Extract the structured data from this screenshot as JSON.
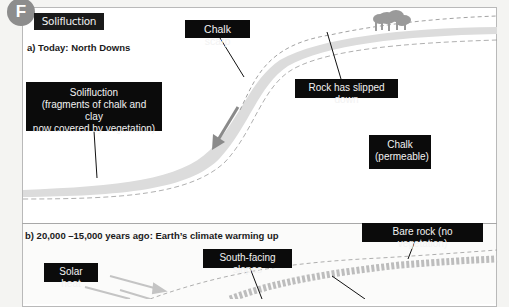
{
  "figure": {
    "badge_letter": "F",
    "title": "Solifluction",
    "colors": {
      "badge": "#8d8d8d",
      "label_bg": "#0b0b0b",
      "label_text": "#f2f2f2",
      "soil_band": "#d9d9d9",
      "dashed_line": "#8a8a8a",
      "arrow": "#8f8f8f",
      "trees": "#9a9a9a"
    }
  },
  "panel_a": {
    "heading": "a) Today: North Downs",
    "labels": {
      "chalk_scarp": "Chalk scarp",
      "rock_slipped": "Rock has slipped down",
      "solifluction_line1": "Solifluction",
      "solifluction_line2": "(fragments of chalk and clay",
      "solifluction_line3": "now covered by vegetation)",
      "chalk_line1": "Chalk",
      "chalk_line2": "(permeable)"
    }
  },
  "panel_b": {
    "heading": "b) 20,000 –15,000 years ago: Earth’s climate warming up",
    "labels": {
      "bare_rock": "Bare rock (no vegetation)",
      "solar_heat": "Solar heat",
      "south_facing": "South-facing slopes"
    }
  }
}
